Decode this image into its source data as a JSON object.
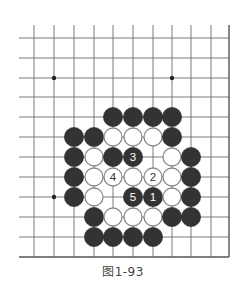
{
  "figure": {
    "caption": "图1-93",
    "board": {
      "columns_x": [
        34,
        54,
        74,
        94,
        113,
        133,
        153,
        172,
        191,
        211,
        229
      ],
      "rows_y": [
        38,
        58,
        78,
        97,
        117,
        137,
        157,
        177,
        197,
        217,
        237,
        257
      ],
      "left_open_x": 19,
      "top_open_y": 25,
      "right_edge": true,
      "bottom_edge": true,
      "line_color": "#6e6e6e",
      "edge_color": "#555555",
      "star_points": [
        [
          1,
          2
        ],
        [
          7,
          2
        ],
        [
          1,
          8
        ]
      ],
      "stone_radius": 9.6,
      "black_color": "#333333",
      "white_fill": "#ffffff",
      "white_stroke": "#8a8a8a",
      "stones": [
        {
          "c": 4,
          "r": 4,
          "color": "black"
        },
        {
          "c": 5,
          "r": 4,
          "color": "black"
        },
        {
          "c": 6,
          "r": 4,
          "color": "black"
        },
        {
          "c": 7,
          "r": 4,
          "color": "black"
        },
        {
          "c": 2,
          "r": 5,
          "color": "black"
        },
        {
          "c": 3,
          "r": 5,
          "color": "black"
        },
        {
          "c": 4,
          "r": 5,
          "color": "white"
        },
        {
          "c": 5,
          "r": 5,
          "color": "white"
        },
        {
          "c": 6,
          "r": 5,
          "color": "white"
        },
        {
          "c": 7,
          "r": 5,
          "color": "black"
        },
        {
          "c": 2,
          "r": 6,
          "color": "black"
        },
        {
          "c": 3,
          "r": 6,
          "color": "white"
        },
        {
          "c": 4,
          "r": 6,
          "color": "black"
        },
        {
          "c": 5,
          "r": 6,
          "color": "black",
          "label": "3"
        },
        {
          "c": 7,
          "r": 6,
          "color": "white"
        },
        {
          "c": 8,
          "r": 6,
          "color": "black"
        },
        {
          "c": 2,
          "r": 7,
          "color": "black"
        },
        {
          "c": 3,
          "r": 7,
          "color": "white"
        },
        {
          "c": 4,
          "r": 7,
          "color": "white",
          "label": "4"
        },
        {
          "c": 5,
          "r": 7,
          "color": "white"
        },
        {
          "c": 6,
          "r": 7,
          "color": "white",
          "label": "2"
        },
        {
          "c": 7,
          "r": 7,
          "color": "white"
        },
        {
          "c": 8,
          "r": 7,
          "color": "black"
        },
        {
          "c": 2,
          "r": 8,
          "color": "black"
        },
        {
          "c": 3,
          "r": 8,
          "color": "white"
        },
        {
          "c": 5,
          "r": 8,
          "color": "black",
          "label": "5"
        },
        {
          "c": 6,
          "r": 8,
          "color": "black",
          "label": "1"
        },
        {
          "c": 7,
          "r": 8,
          "color": "white"
        },
        {
          "c": 8,
          "r": 8,
          "color": "black"
        },
        {
          "c": 3,
          "r": 9,
          "color": "black"
        },
        {
          "c": 4,
          "r": 9,
          "color": "white"
        },
        {
          "c": 5,
          "r": 9,
          "color": "white"
        },
        {
          "c": 6,
          "r": 9,
          "color": "white"
        },
        {
          "c": 7,
          "r": 9,
          "color": "black"
        },
        {
          "c": 8,
          "r": 9,
          "color": "black"
        },
        {
          "c": 3,
          "r": 10,
          "color": "black"
        },
        {
          "c": 4,
          "r": 10,
          "color": "black"
        },
        {
          "c": 5,
          "r": 10,
          "color": "black"
        },
        {
          "c": 6,
          "r": 10,
          "color": "black"
        }
      ]
    }
  }
}
